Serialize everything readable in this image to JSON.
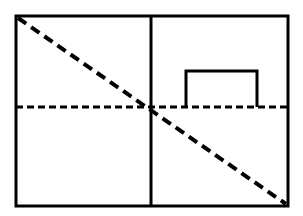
{
  "figure": {
    "type": "line-diagram",
    "background_color": "#ffffff",
    "stroke_color": "#000000",
    "canvas": {
      "width": 303,
      "height": 216
    }
  },
  "shapes": {
    "outer_rectangle": {
      "name": "outer-rectangle",
      "x": 16,
      "y": 16,
      "width": 272,
      "height": 190,
      "stroke_width": 3,
      "style": "solid",
      "fill": "none"
    },
    "vertical_divider": {
      "name": "vertical-divider-line",
      "x1": 151,
      "y1": 16,
      "x2": 151,
      "y2": 206,
      "stroke_width": 3,
      "style": "solid"
    },
    "horizontal_dashed": {
      "name": "horizontal-dashed-line",
      "x1": 16,
      "y1": 107,
      "x2": 288,
      "y2": 107,
      "stroke_width": 3,
      "style": "dashed",
      "dash": "7 4"
    },
    "diagonal_dashed": {
      "name": "diagonal-dashed-line",
      "x1": 18,
      "y1": 18,
      "x2": 286,
      "y2": 204,
      "stroke_width": 4,
      "style": "dashed",
      "dash": "10 6"
    },
    "inner_box": {
      "name": "inner-goal-box",
      "points": "186,107 186,71 257,71 257,107",
      "stroke_width": 3,
      "style": "solid",
      "fill": "none"
    }
  },
  "labels": {
    "outer_rectangle": "Outer boundary rectangle",
    "vertical_divider": "Vertical divider line",
    "horizontal_dashed": "Horizontal dashed midline",
    "diagonal_dashed": "Diagonal dashed line",
    "inner_box": "Small open-bottom box (upper right quadrant)"
  }
}
